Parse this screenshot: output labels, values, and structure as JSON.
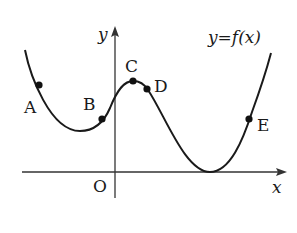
{
  "figure": {
    "function_label": "y=f(x)",
    "axes": {
      "x_label": "x",
      "y_label": "y",
      "origin_label": "O"
    },
    "points": [
      {
        "name": "A",
        "label": "A"
      },
      {
        "name": "B",
        "label": "B"
      },
      {
        "name": "C",
        "label": "C"
      },
      {
        "name": "D",
        "label": "D"
      },
      {
        "name": "E",
        "label": "E"
      }
    ],
    "colors": {
      "curve": "#1a1a1a",
      "axis": "#333333",
      "background": "#ffffff"
    }
  }
}
